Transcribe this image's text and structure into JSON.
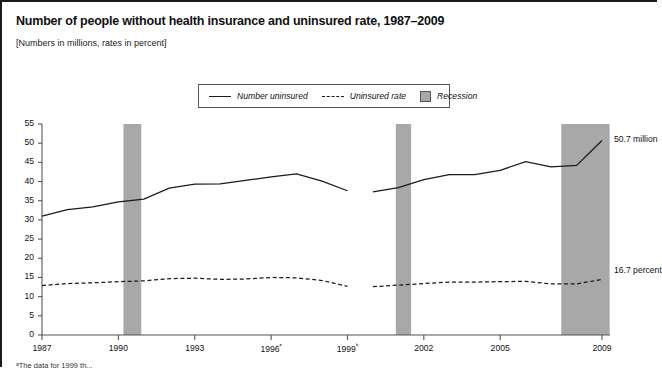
{
  "title": "Number of people without health insurance and uninsured rate, 1987–2009",
  "subtitle": "[Numbers in millions, rates in percent]",
  "legend": {
    "number_uninsured": "Number uninsured",
    "uninsured_rate": "Uninsured rate",
    "recession": "Recession"
  },
  "annotations": {
    "number_end": "50.7 million",
    "rate_end": "16.7 percent"
  },
  "footnote": "ᵃThe data for 1999 th...",
  "colors": {
    "line": "#1a1a1a",
    "recession_band": "#a8a8a8",
    "axis": "#555555",
    "background": "#ffffff"
  },
  "chart_data": {
    "type": "line",
    "title": "Number of people without health insurance and uninsured rate, 1987–2009",
    "subtitle": "[Numbers in millions, rates in percent]",
    "xlabel": "",
    "ylabel": "",
    "xlim": [
      1987,
      2009
    ],
    "ylim": [
      0,
      55
    ],
    "yticks": [
      0,
      5,
      10,
      15,
      20,
      25,
      30,
      35,
      40,
      45,
      50,
      55
    ],
    "xticks": [
      1987,
      1990,
      1993,
      1996,
      1999,
      2002,
      2005,
      2009
    ],
    "xticklabels": [
      "1987",
      "1990",
      "1993",
      "1996ᵃ",
      "1999ᵇ",
      "2002",
      "2005",
      "2009"
    ],
    "grid": false,
    "legend_position": "top-center",
    "x": [
      1987,
      1988,
      1989,
      1990,
      1991,
      1992,
      1993,
      1994,
      1995,
      1996,
      1997,
      1998,
      1999,
      2000,
      2001,
      2002,
      2003,
      2004,
      2005,
      2006,
      2007,
      2008,
      2009
    ],
    "series": [
      {
        "name": "Number uninsured",
        "style": "solid",
        "unit": "millions",
        "break_after_year": 1999,
        "values": [
          31.0,
          32.7,
          33.4,
          34.7,
          35.4,
          38.3,
          39.3,
          39.4,
          40.3,
          41.2,
          42.0,
          40.1,
          37.6,
          37.3,
          38.4,
          40.5,
          41.8,
          41.8,
          42.9,
          45.2,
          43.8,
          44.2,
          50.7
        ],
        "values_post_break": {
          "1999": 37.6,
          "2000": 37.3,
          "2001": 38.4,
          "2002": 40.5,
          "2003": 41.8,
          "2004": 41.8,
          "2005": 42.9,
          "2006": 45.2,
          "2007": 43.8,
          "2008": 44.2,
          "2009": 50.7
        },
        "end_label": "50.7 million"
      },
      {
        "name": "Uninsured rate",
        "style": "dashed",
        "unit": "percent",
        "break_after_year": 1999,
        "values": [
          12.9,
          13.4,
          13.6,
          13.9,
          14.1,
          14.7,
          14.8,
          14.5,
          14.6,
          15.0,
          14.9,
          14.2,
          12.7,
          12.6,
          13.0,
          13.4,
          13.8,
          13.8,
          13.9,
          14.0,
          13.3,
          13.3,
          14.5
        ],
        "end_label": "16.7 percent"
      }
    ],
    "recession_bands": [
      {
        "start": 1990.2,
        "end": 1990.9,
        "label": "Recession"
      },
      {
        "start": 2000.9,
        "end": 2001.5,
        "label": "Recession"
      },
      {
        "start": 2007.4,
        "end": 2009.3,
        "label": "Recession"
      }
    ]
  }
}
